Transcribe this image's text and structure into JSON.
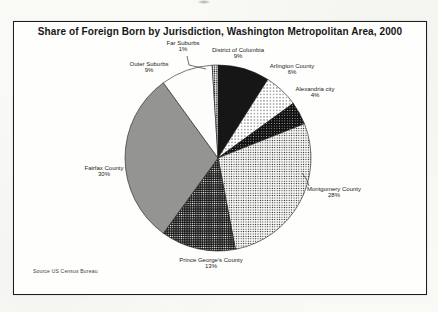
{
  "chart_data": {
    "type": "pie",
    "title": "Share of Foreign Born by Jurisdiction, Washington Metropolitan Area, 2000",
    "source_note": "Source US Census Bureau",
    "unit": "%",
    "start_position": "12-o-clock",
    "direction": "clockwise",
    "legend_position": "none",
    "colors": {
      "ink": "#161616",
      "paper": "#ffffff"
    },
    "slices": [
      {
        "label": "District of Columbia",
        "value": 9,
        "pct_label": "9%",
        "pattern": "solid-black"
      },
      {
        "label": "Arlington County",
        "value": 6,
        "pct_label": "6%",
        "pattern": "dots-10"
      },
      {
        "label": "Alexandria city",
        "value": 4,
        "pct_label": "4%",
        "pattern": "dots-90"
      },
      {
        "label": "Montgomery County",
        "value": 28,
        "pct_label": "28%",
        "pattern": "dots-20"
      },
      {
        "label": "Prince George's County",
        "value": 13,
        "pct_label": "13%",
        "pattern": "dots-70"
      },
      {
        "label": "Fairfax County",
        "value": 30,
        "pct_label": "30%",
        "pattern": "dots-50"
      },
      {
        "label": "Outer Suburbs",
        "value": 9,
        "pct_label": "9%",
        "pattern": "white"
      },
      {
        "label": "Far Suburbs",
        "value": 1,
        "pct_label": "1%",
        "pattern": "dots-30"
      }
    ]
  }
}
